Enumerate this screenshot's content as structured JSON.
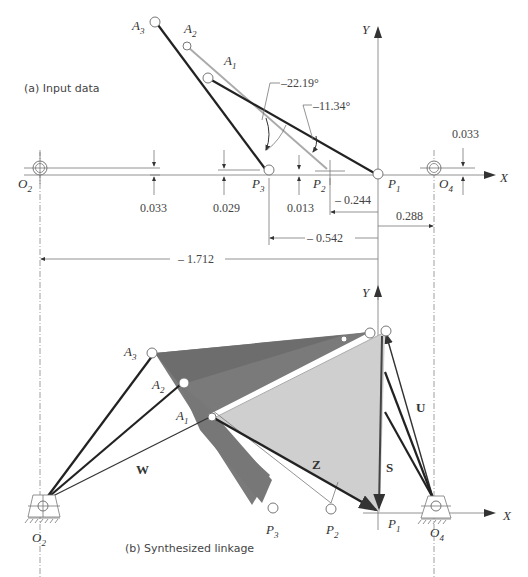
{
  "panel_a": {
    "caption": "(a)  Input data",
    "axis_x_label": "X",
    "axis_y_label": "Y",
    "points": {
      "A1": "A",
      "A1_sub": "1",
      "A2": "A",
      "A2_sub": "2",
      "A3": "A",
      "A3_sub": "3",
      "P1": "P",
      "P1_sub": "1",
      "P2": "P",
      "P2_sub": "2",
      "P3": "P",
      "P3_sub": "3",
      "O2": "O",
      "O2_sub": "2",
      "O4": "O",
      "O4_sub": "4"
    },
    "angles": {
      "alpha2": "–22.19°",
      "alpha3": "–11.34°"
    },
    "dimensions": {
      "o2_y": "0.033",
      "p3_y": "0.029",
      "p2_y": "0.013",
      "o4_y": "0.033",
      "p2_x": "– 0.244",
      "o4_x": "0.288",
      "p3_x": "– 0.542",
      "o2_x": "– 1.712"
    }
  },
  "panel_b": {
    "caption": "(b)  Synthesized linkage",
    "axis_x_label": "X",
    "axis_y_label": "Y",
    "points": {
      "A1": "A",
      "A1_sub": "1",
      "A2": "A",
      "A2_sub": "2",
      "A3": "A",
      "A3_sub": "3",
      "P1": "P",
      "P1_sub": "1",
      "P2": "P",
      "P2_sub": "2",
      "P3": "P",
      "P3_sub": "3",
      "O2": "O",
      "O2_sub": "2",
      "O4": "O",
      "O4_sub": "4"
    },
    "vectors": {
      "W": "W",
      "Z": "Z",
      "U": "U",
      "S": "S"
    }
  },
  "colors": {
    "link_dark": "#222222",
    "link_gray": "#aaaaaa",
    "coupler_light": "#cfcfcf",
    "coupler_dark": "#7a7a7a"
  }
}
